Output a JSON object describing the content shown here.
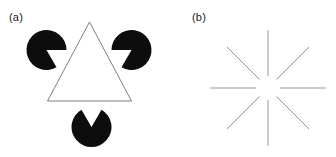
{
  "figure": {
    "background_color": "#ffffff",
    "width": 336,
    "height": 157,
    "panels": [
      {
        "id": "panel-a",
        "label": "(a)",
        "name": "kanizsa-triangle-illusion",
        "label_x": 9,
        "label_y": 11,
        "elements": {
          "inducer_color": "#0d0d0d",
          "outline_color": "#6e6e6e",
          "outline_width": 0.9,
          "discs": [
            {
              "name": "pacman-disc-top-left",
              "cx": 46.5,
              "cy": 50.0,
              "r": 20.0,
              "wedge_start_deg": 0,
              "wedge_end_deg": 60
            },
            {
              "name": "pacman-disc-top-right",
              "cx": 131.5,
              "cy": 50.0,
              "r": 20.0,
              "wedge_start_deg": 120,
              "wedge_end_deg": 180
            },
            {
              "name": "pacman-disc-bottom",
              "cx": 91.5,
              "cy": 127.0,
              "r": 20.0,
              "wedge_start_deg": 240,
              "wedge_end_deg": 300
            }
          ],
          "triangle_outline": {
            "name": "illusory-triangle-outline",
            "apex_x": 89.5,
            "apex_y": 22.0,
            "left_x": 47.5,
            "left_y": 101.0,
            "right_x": 131.5,
            "right_y": 101.0
          }
        }
      },
      {
        "id": "panel-b",
        "label": "(b)",
        "name": "ehrenstein-starburst-illusion",
        "label_x": 24,
        "label_y": 11,
        "elements": {
          "line_color": "#8a8a8a",
          "line_width": 0.9,
          "center_x": 100.0,
          "center_y": 88.0,
          "inner_radius": 12.0,
          "outer_radius": 58.0,
          "ray_count": 8,
          "ray_angles_deg": [
            0,
            45,
            90,
            135,
            180,
            225,
            270,
            315
          ]
        }
      }
    ]
  }
}
